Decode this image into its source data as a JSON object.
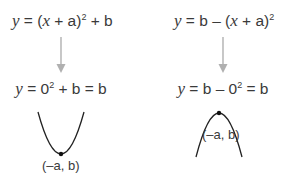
{
  "left": {
    "equation_general": {
      "y": "y",
      "eq": " = (",
      "x": "x",
      "rest": " + a)",
      "exp": "2",
      "tail": " + b"
    },
    "equation_vertex": {
      "y": "y",
      "eq": " = 0",
      "exp": "2",
      "tail": " + b = b"
    },
    "vertex_label": "(–a, b)",
    "shape": "u-shaped-parabola-minimum"
  },
  "right": {
    "equation_general": {
      "y": "y",
      "eq": " = b – (",
      "x": "x",
      "rest": " + a)",
      "exp": "2"
    },
    "equation_vertex": {
      "y": "y",
      "eq": " = b – 0",
      "exp": "2",
      "tail": " = b"
    },
    "vertex_label": "(–a, b)",
    "shape": "n-shaped-parabola-maximum"
  },
  "colors": {
    "text": "#3a3a3a",
    "arrow": "#b0b0b0",
    "curve": "#222222",
    "vertex_dot": "#111111",
    "background": "#ffffff"
  }
}
